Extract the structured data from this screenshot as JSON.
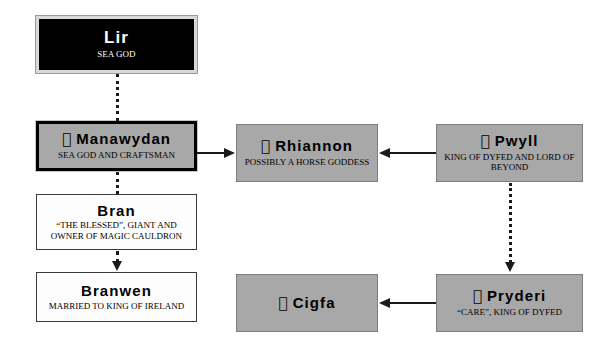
{
  "diagram": {
    "background": "#ffffff",
    "colors": {
      "dark_box_bg": "#000000",
      "dark_box_text": "#ffffff",
      "gray_box_bg": "#a8a8a8",
      "white_box_bg": "#fdfdfd",
      "line": "#1a1a1a"
    },
    "apple_glyph": ""
  },
  "nodes": {
    "lir": {
      "name": "Lir",
      "subtitle": "Sea God",
      "has_apple_icon": false,
      "style": "dark"
    },
    "manawydan": {
      "name": "Manawydan",
      "subtitle": "Sea God and Craftsman",
      "has_apple_icon": true,
      "apple": "",
      "style": "gray-heavy"
    },
    "bran": {
      "name": "Bran",
      "subtitle_line1": "“the Blessed”, giant and",
      "subtitle_line2": "owner of magic cauldron",
      "has_apple_icon": false,
      "style": "white"
    },
    "branwen": {
      "name": "Branwen",
      "subtitle": "Married to King of Ireland",
      "has_apple_icon": false,
      "style": "white"
    },
    "rhiannon": {
      "name": "Rhiannon",
      "subtitle": "Possibly a horse goddess",
      "has_apple_icon": true,
      "apple": "",
      "style": "gray"
    },
    "pwyll": {
      "name": "Pwyll",
      "subtitle_line1": "King of Dyfed and Lord of",
      "subtitle_line2": "Beyond",
      "has_apple_icon": true,
      "apple": "",
      "style": "gray"
    },
    "cigfa": {
      "name": "Cigfa",
      "subtitle": "",
      "has_apple_icon": true,
      "apple": "",
      "style": "gray"
    },
    "pryderi": {
      "name": "Pryderi",
      "subtitle": "“Care”, King of Dyfed",
      "has_apple_icon": true,
      "apple": "",
      "style": "gray"
    }
  },
  "edges": [
    {
      "id": "lir-manawydan",
      "from": "lir",
      "to": "manawydan",
      "style": "dotted",
      "direction": "down",
      "arrowhead": false
    },
    {
      "id": "manawydan-bran",
      "from": "manawydan",
      "to": "bran",
      "style": "dotted",
      "direction": "down",
      "arrowhead": false
    },
    {
      "id": "bran-branwen",
      "from": "bran",
      "to": "branwen",
      "style": "dotted",
      "direction": "down",
      "arrowhead": true
    },
    {
      "id": "manawydan-rhiannon",
      "from": "manawydan",
      "to": "rhiannon",
      "style": "solid",
      "direction": "right",
      "arrowhead": true
    },
    {
      "id": "pwyll-rhiannon",
      "from": "pwyll",
      "to": "rhiannon",
      "style": "solid",
      "direction": "left",
      "arrowhead": true
    },
    {
      "id": "pwyll-pryderi",
      "from": "pwyll",
      "to": "pryderi",
      "style": "dotted",
      "direction": "down",
      "arrowhead": true
    },
    {
      "id": "pryderi-cigfa",
      "from": "pryderi",
      "to": "cigfa",
      "style": "solid",
      "direction": "left",
      "arrowhead": true
    }
  ]
}
